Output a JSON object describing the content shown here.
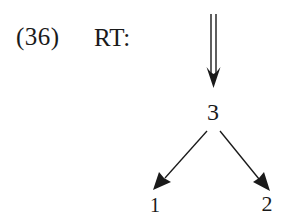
{
  "example": {
    "number": "(36)",
    "tag": "RT:"
  },
  "diagram": {
    "type": "tree",
    "root_arrow": "double-down-arrow",
    "nodes": [
      {
        "id": "3",
        "label": "3",
        "role": "parent"
      },
      {
        "id": "1",
        "label": "1",
        "role": "child-left"
      },
      {
        "id": "2",
        "label": "2",
        "role": "child-right"
      }
    ],
    "edges": [
      {
        "from": "3",
        "to": "1"
      },
      {
        "from": "3",
        "to": "2"
      }
    ],
    "ink_color": "#1a1a1a"
  }
}
